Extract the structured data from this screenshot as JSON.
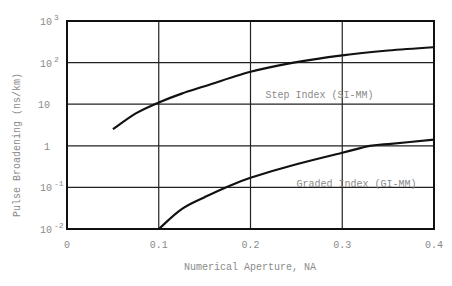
{
  "chart_data": {
    "type": "line",
    "title": "",
    "xlabel": "Numerical Aperture,  NA",
    "ylabel": "Pulse Broadening  (ns/km)",
    "xscale": "linear",
    "yscale": "log",
    "xlim": [
      0,
      0.4
    ],
    "ylim": [
      0.01,
      1000
    ],
    "grid": true,
    "legend": "none (inline curve labels)",
    "x_ticks": [
      {
        "value": 0,
        "label": "0"
      },
      {
        "value": 0.1,
        "label": "0.1"
      },
      {
        "value": 0.2,
        "label": "0.2"
      },
      {
        "value": 0.3,
        "label": "0.3"
      },
      {
        "value": 0.4,
        "label": "0.4"
      }
    ],
    "y_ticks": [
      {
        "value": 1000,
        "base": "10",
        "exp": "3"
      },
      {
        "value": 100,
        "base": "10",
        "exp": "2"
      },
      {
        "value": 10,
        "base": "10",
        "exp": ""
      },
      {
        "value": 1,
        "base": "1",
        "exp": ""
      },
      {
        "value": 0.1,
        "base": "10",
        "exp": "-1"
      },
      {
        "value": 0.01,
        "base": "10",
        "exp": "-2"
      }
    ],
    "series": [
      {
        "name": "Step Index (SI-MM)",
        "label_pos": {
          "x": 0.163,
          "y": 18
        },
        "x": [
          0.05,
          0.075,
          0.1,
          0.125,
          0.15,
          0.2,
          0.247,
          0.3,
          0.35,
          0.4
        ],
        "y": [
          2.5,
          6,
          11,
          18,
          27,
          60,
          100,
          150,
          195,
          235
        ]
      },
      {
        "name": "Graded Index (GI-MM)",
        "label_pos": {
          "x": 0.25,
          "y": 0.13
        },
        "x": [
          0.1,
          0.125,
          0.15,
          0.173,
          0.2,
          0.25,
          0.3,
          0.33,
          0.35,
          0.4
        ],
        "y": [
          0.01,
          0.03,
          0.058,
          0.1,
          0.17,
          0.36,
          0.68,
          1.0,
          1.1,
          1.4
        ]
      }
    ]
  }
}
